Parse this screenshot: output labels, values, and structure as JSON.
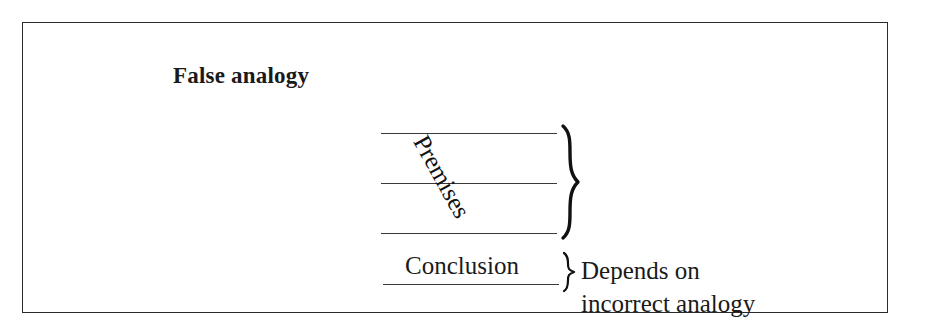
{
  "figure": {
    "title": "False analogy",
    "border_color": "#2b2b2b",
    "background_color": "#ffffff",
    "text_color": "#1a1a1a"
  },
  "diagram": {
    "premises": {
      "label": "Premises",
      "rule_count": 3,
      "rotation_degrees": 61,
      "brace_glyph": "}"
    },
    "conclusion": {
      "label": "Conclusion",
      "brace_glyph": "}"
    },
    "annotation": {
      "line_1": "Depends on",
      "line_2": "incorrect analogy"
    }
  }
}
